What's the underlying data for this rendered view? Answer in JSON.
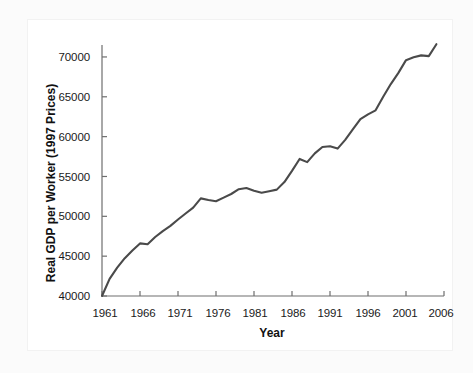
{
  "chart_data": {
    "type": "line",
    "title": "",
    "xlabel": "Year",
    "ylabel": "Real GDP per Worker (1997 Prices)",
    "xlim": [
      1961,
      2006
    ],
    "ylim": [
      40000,
      71500
    ],
    "xticks": [
      1961,
      1966,
      1971,
      1976,
      1981,
      1986,
      1991,
      1996,
      2001,
      2006
    ],
    "yticks": [
      40000,
      45000,
      50000,
      55000,
      60000,
      65000,
      70000
    ],
    "grid": false,
    "legend": null,
    "line_color": "#4a4a4a",
    "axis_color": "#6e6e6e",
    "series": [
      {
        "name": "Real GDP per Worker (1997 Prices)",
        "x": [
          1961,
          1962,
          1963,
          1964,
          1965,
          1966,
          1967,
          1968,
          1969,
          1970,
          1971,
          1972,
          1973,
          1974,
          1975,
          1976,
          1977,
          1978,
          1979,
          1980,
          1981,
          1982,
          1983,
          1984,
          1985,
          1986,
          1987,
          1988,
          1989,
          1990,
          1991,
          1992,
          1993,
          1994,
          1995,
          1996,
          1997,
          1998,
          1999,
          2000,
          2001,
          2002,
          2003,
          2004,
          2005
        ],
        "values": [
          40000,
          42150,
          43550,
          44750,
          45700,
          46600,
          46500,
          47400,
          48150,
          48800,
          49600,
          50350,
          51100,
          52250,
          52050,
          51900,
          52350,
          52800,
          53400,
          53550,
          53200,
          52950,
          53150,
          53350,
          54300,
          55700,
          57200,
          56800,
          57900,
          58700,
          58800,
          58500,
          59600,
          60900,
          62200,
          62800,
          63300,
          65000,
          66600,
          68000,
          69600,
          69950,
          70200,
          70100,
          71600
        ]
      }
    ]
  },
  "axis": {
    "ytick_labels": [
      "40000",
      "45000",
      "50000",
      "55000",
      "60000",
      "65000",
      "70000"
    ],
    "xtick_labels": [
      "1961",
      "1966",
      "1971",
      "1976",
      "1981",
      "1986",
      "1991",
      "1996",
      "2001",
      "2006"
    ]
  }
}
